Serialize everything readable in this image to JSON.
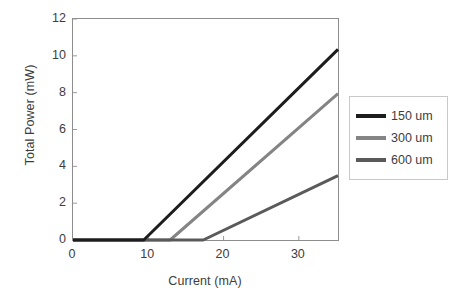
{
  "chart_data": {
    "type": "line",
    "title": "",
    "xlabel": "Current (mA)",
    "ylabel": "Total Power (mW)",
    "xlim": [
      0,
      35.2
    ],
    "ylim": [
      0,
      12
    ],
    "xticks": [
      0,
      10,
      20,
      30
    ],
    "yticks": [
      0,
      2,
      4,
      6,
      8,
      10,
      12
    ],
    "xtick_labels": [
      "0",
      "10",
      "20",
      "30"
    ],
    "ytick_labels": [
      "0",
      "2",
      "4",
      "6",
      "8",
      "10",
      "12"
    ],
    "grid": false,
    "legend_position": "right",
    "series": [
      {
        "name": "150 um",
        "color": "#1d1d1d",
        "threshold_mA": 9.4,
        "x": [
          0,
          9.4,
          35.2
        ],
        "y": [
          0,
          0,
          10.35
        ]
      },
      {
        "name": "300 um",
        "color": "#848484",
        "threshold_mA": 12.9,
        "x": [
          0,
          12.9,
          35.2
        ],
        "y": [
          0,
          0,
          7.95
        ]
      },
      {
        "name": "600 um",
        "color": "#5a5a5a",
        "threshold_mA": 17.3,
        "x": [
          0,
          17.3,
          35.2
        ],
        "y": [
          0,
          0,
          3.5
        ]
      }
    ]
  },
  "legend": {
    "entries": [
      {
        "label": "150 um",
        "color": "#1d1d1d"
      },
      {
        "label": "300 um",
        "color": "#848484"
      },
      {
        "label": "600 um",
        "color": "#5a5a5a"
      }
    ]
  },
  "axes": {
    "x_title": "Current (mA)",
    "y_title": "Total Power (mW)"
  }
}
